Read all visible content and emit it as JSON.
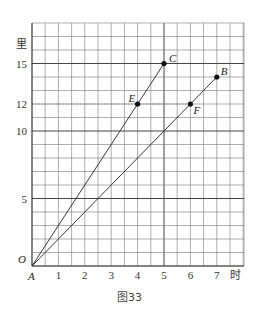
{
  "chart_data": {
    "type": "line",
    "title": "",
    "caption": "图33",
    "xlabel": "时",
    "ylabel": "里",
    "xlim": [
      0,
      8
    ],
    "ylim": [
      0,
      18
    ],
    "x_ticks": [
      "1",
      "2",
      "3",
      "4",
      "5",
      "6",
      "7"
    ],
    "y_ticks": [
      "5",
      "10",
      "12",
      "15"
    ],
    "origin_labels": {
      "O": "O",
      "A": "A"
    },
    "grid": true,
    "series": [
      {
        "name": "AC",
        "points": [
          [
            0,
            0
          ],
          [
            4,
            12
          ],
          [
            5,
            15
          ]
        ],
        "labels": [
          "A",
          "E",
          "C"
        ]
      },
      {
        "name": "AB",
        "points": [
          [
            0,
            0
          ],
          [
            6,
            12
          ],
          [
            7,
            14
          ]
        ],
        "labels": [
          "A",
          "F",
          "B"
        ]
      }
    ],
    "annotations": [
      {
        "label": "C",
        "x": 5,
        "y": 15
      },
      {
        "label": "B",
        "x": 7,
        "y": 14
      },
      {
        "label": "E",
        "x": 4,
        "y": 12
      },
      {
        "label": "F",
        "x": 6,
        "y": 12
      }
    ],
    "reference_line": {
      "y": 12,
      "style": "dotted"
    }
  }
}
